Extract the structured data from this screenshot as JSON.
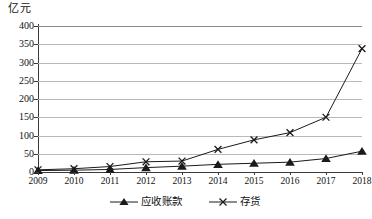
{
  "chart_data": {
    "type": "line",
    "title": "",
    "subtitle": "",
    "xlabel": "",
    "ylabel": "亿元",
    "unit_label": "亿元",
    "categories": [
      "2009",
      "2010",
      "2011",
      "2012",
      "2013",
      "2014",
      "2015",
      "2016",
      "2017",
      "2018"
    ],
    "ylim": [
      0,
      400
    ],
    "yticks": [
      0,
      50,
      100,
      150,
      200,
      250,
      300,
      350,
      400
    ],
    "ytick_labels": [
      "0",
      "50",
      "100",
      "150",
      "200",
      "250",
      "300",
      "350",
      "400"
    ],
    "grid": true,
    "legend_position": "bottom",
    "series": [
      {
        "name": "应收账款",
        "marker": "triangle",
        "color": "#1a1a1a",
        "values": [
          4,
          5,
          7,
          12,
          16,
          21,
          24,
          27,
          37,
          57
        ]
      },
      {
        "name": "存货",
        "marker": "x",
        "color": "#1a1a1a",
        "values": [
          6,
          9,
          15,
          28,
          30,
          62,
          88,
          108,
          150,
          338
        ]
      }
    ]
  },
  "legend": {
    "items": [
      {
        "label": "应收账款",
        "marker": "triangle-marker"
      },
      {
        "label": "存货",
        "marker": "x-marker"
      }
    ]
  }
}
